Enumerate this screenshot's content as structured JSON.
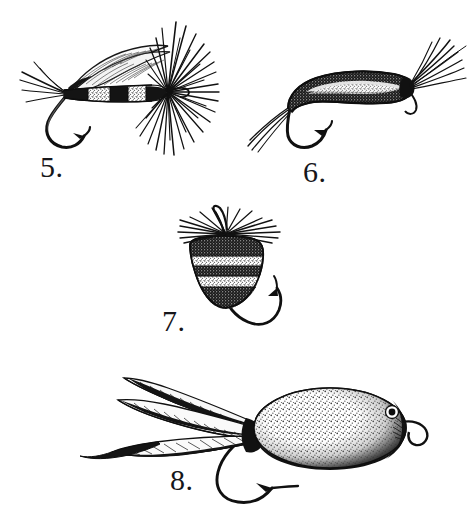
{
  "plate": {
    "title": "Fishing Fly Illustration Plate",
    "medium": "pen-and-ink line engraving",
    "background_color": "#ffffff",
    "ink_color": "#111111",
    "width": 475,
    "height": 531,
    "figure_count": 4
  },
  "figures": [
    {
      "number": "5.",
      "label": "5.",
      "name": "banded-body-dry-fly",
      "description": "Winged dry fly with segmented banded body, tail fibers, hook and dense radiating hackle at the head",
      "parts": [
        "tail-fibers",
        "banded-body",
        "wing",
        "hackle",
        "hook"
      ],
      "bands": 4,
      "hackle_fiber_count": 34,
      "tail_fiber_count": 5
    },
    {
      "number": "6.",
      "label": "6.",
      "name": "curved-nymph-larva-fly",
      "description": "Curved speckled larva or nymph body with trailing tail fibers and a sparse swept hackle wing at the head",
      "parts": [
        "tail-fibers",
        "curved-speckled-body",
        "swept-hackle",
        "hook"
      ],
      "hackle_fiber_count": 9,
      "tail_fiber_count": 4
    },
    {
      "number": "7.",
      "label": "7.",
      "name": "banded-bee-bug-fly",
      "description": "Bulbous bee-style body with alternating dark and light horizontal bands, splayed horizontal hackle and downturned hook",
      "parts": [
        "banded-bee-body",
        "splayed-hackle",
        "hook"
      ],
      "bands": 5,
      "hackle_fiber_count": 18
    },
    {
      "number": "8.",
      "label": "8.",
      "name": "cork-body-popper-bass-bug",
      "description": "Oval stippled cork popper body with painted eye, wire hook eye loop and a long four-feather hackle tail",
      "parts": [
        "feather-tail",
        "stippled-oval-body",
        "eye",
        "hook-eye-loop",
        "hook"
      ],
      "feather_count": 4,
      "has_eye": true
    }
  ],
  "colors": {
    "ink": "#111111",
    "paper": "#ffffff",
    "mid_tone": "#4a4a4a",
    "light_tone": "#9a9a9a"
  }
}
